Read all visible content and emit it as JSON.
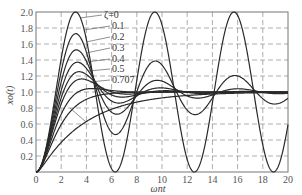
{
  "chart_data": {
    "type": "line",
    "title": "",
    "xlabel": "ωnt",
    "ylabel": "xo(t)",
    "xlim": [
      0,
      20
    ],
    "ylim": [
      0,
      2.0
    ],
    "x_ticks": [
      0,
      2,
      4,
      6,
      8,
      10,
      12,
      14,
      16,
      18,
      20
    ],
    "y_ticks": [
      0.2,
      0.4,
      0.6,
      0.8,
      1.0,
      1.2,
      1.4,
      1.6,
      1.8,
      2.0
    ],
    "grid": "dashed",
    "legend_position": "inline leader labels, upper-left",
    "formula": "x(t) = 1 - e^(-ζωnt)/sqrt(1-ζ²) · sin(sqrt(1-ζ²)ωnt + arccos ζ)",
    "series": [
      {
        "name": "ζ=0",
        "zeta": 0,
        "peak": 2.0,
        "peak_at": 3.14
      },
      {
        "name": "0.1",
        "zeta": 0.1,
        "peak": 1.73,
        "peak_at": 3.16
      },
      {
        "name": "0.2",
        "zeta": 0.2,
        "peak": 1.53,
        "peak_at": 3.21
      },
      {
        "name": "0.3",
        "zeta": 0.3,
        "peak": 1.37,
        "peak_at": 3.29
      },
      {
        "name": "0.4",
        "zeta": 0.4,
        "peak": 1.25,
        "peak_at": 3.43
      },
      {
        "name": "0.5",
        "zeta": 0.5,
        "peak": 1.16,
        "peak_at": 3.63
      },
      {
        "name": "0.707",
        "zeta": 0.707,
        "peak": 1.04,
        "peak_at": 4.44
      },
      {
        "name": "1.0",
        "zeta": 1.0,
        "peak": 1.0,
        "peak_at": null
      },
      {
        "name": "2.0",
        "zeta": 2.0,
        "peak": 1.0,
        "peak_at": null
      }
    ]
  },
  "labels": {
    "z0": "ζ=0",
    "z1": "0.1",
    "z2": "0.2",
    "z3": "0.3",
    "z4": "0.4",
    "z5": "0.5",
    "z707": "0.707",
    "xlabel": "ωnt",
    "ylabel": "xo(t)"
  },
  "colors": {
    "curve": "#2a2a2a",
    "grid": "#8a8a8a",
    "frame": "#777777",
    "text": "#555555"
  }
}
